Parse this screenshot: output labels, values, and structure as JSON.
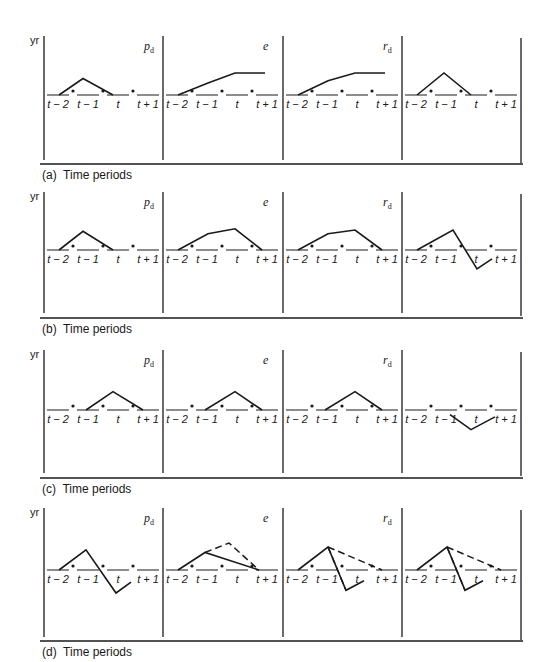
{
  "figure": {
    "y_axis_label": "yr",
    "time_labels": [
      "t − 2",
      "t − 1",
      "t",
      "t + 1"
    ],
    "panel_variables": [
      {
        "base": "p",
        "sub": "d"
      },
      {
        "base": "e",
        "sub": ""
      },
      {
        "base": "r",
        "sub": "d"
      },
      {
        "base": "",
        "sub": ""
      }
    ],
    "rows": [
      {
        "id": "a",
        "caption": "(a)  Time periods"
      },
      {
        "id": "b",
        "caption": "(b)  Time periods"
      },
      {
        "id": "c",
        "caption": "(c)  Time periods"
      },
      {
        "id": "d",
        "caption": "(d)  Time periods"
      }
    ],
    "colors": {
      "ink": "#1a1a1a",
      "background": "#ffffff"
    }
  },
  "chart_data": {
    "type": "line",
    "xlabel": "Time periods",
    "ylabel": "yr",
    "x": [
      "t-2",
      "t-1",
      "t",
      "t+1"
    ],
    "panels": [
      {
        "row": "a",
        "variable": "p_d",
        "solid": [
          [
            0.4,
            0
          ],
          [
            1.2,
            0.75
          ],
          [
            2.2,
            0
          ]
        ],
        "dashed": []
      },
      {
        "row": "a",
        "variable": "e",
        "solid": [
          [
            0.4,
            0
          ],
          [
            1.4,
            0.55
          ],
          [
            2.3,
            1.0
          ],
          [
            3.3,
            1.0
          ]
        ],
        "dashed": []
      },
      {
        "row": "a",
        "variable": "r_d",
        "solid": [
          [
            0.4,
            0
          ],
          [
            1.4,
            0.65
          ],
          [
            2.3,
            1.0
          ],
          [
            3.3,
            1.0
          ]
        ],
        "dashed": []
      },
      {
        "row": "a",
        "variable": "",
        "solid": [
          [
            0.4,
            0
          ],
          [
            1.3,
            1.0
          ],
          [
            2.2,
            0
          ]
        ],
        "dashed": []
      },
      {
        "row": "b",
        "variable": "p_d",
        "solid": [
          [
            0.4,
            0
          ],
          [
            1.2,
            0.75
          ],
          [
            2.2,
            0
          ]
        ],
        "dashed": []
      },
      {
        "row": "b",
        "variable": "e",
        "solid": [
          [
            0.4,
            0
          ],
          [
            1.4,
            0.65
          ],
          [
            2.3,
            0.85
          ],
          [
            3.2,
            0
          ]
        ],
        "dashed": []
      },
      {
        "row": "b",
        "variable": "r_d",
        "solid": [
          [
            0.4,
            0
          ],
          [
            1.4,
            0.65
          ],
          [
            2.3,
            0.8
          ],
          [
            3.2,
            0
          ]
        ],
        "dashed": []
      },
      {
        "row": "b",
        "variable": "",
        "solid": [
          [
            0.4,
            0
          ],
          [
            1.6,
            0.8
          ],
          [
            2.4,
            -0.75
          ],
          [
            2.9,
            -0.35
          ]
        ],
        "dashed": []
      },
      {
        "row": "c",
        "variable": "p_d",
        "solid": [
          [
            1.3,
            0
          ],
          [
            2.2,
            0.8
          ],
          [
            3.2,
            0
          ]
        ],
        "dashed": []
      },
      {
        "row": "c",
        "variable": "e",
        "solid": [
          [
            1.3,
            0
          ],
          [
            2.3,
            0.8
          ],
          [
            3.2,
            0
          ]
        ],
        "dashed": []
      },
      {
        "row": "c",
        "variable": "r_d",
        "solid": [
          [
            1.3,
            0
          ],
          [
            2.3,
            0.8
          ],
          [
            3.2,
            0
          ]
        ],
        "dashed": []
      },
      {
        "row": "c",
        "variable": "",
        "solid": [
          [
            1.5,
            -0.2
          ],
          [
            2.2,
            -0.85
          ],
          [
            3.0,
            -0.3
          ]
        ],
        "dashed": []
      },
      {
        "row": "d",
        "variable": "p_d",
        "solid": [
          [
            0.4,
            0
          ],
          [
            1.3,
            0.75
          ],
          [
            2.3,
            -0.85
          ],
          [
            2.8,
            -0.45
          ]
        ],
        "dashed": []
      },
      {
        "row": "d",
        "variable": "e",
        "solid": [
          [
            0.4,
            0
          ],
          [
            1.3,
            0.65
          ],
          [
            3.1,
            0
          ]
        ],
        "dashed": [
          [
            1.3,
            0.65
          ],
          [
            2.1,
            1.0
          ],
          [
            3.1,
            0
          ]
        ]
      },
      {
        "row": "d",
        "variable": "r_d",
        "solid": [
          [
            0.4,
            0
          ],
          [
            1.4,
            0.85
          ],
          [
            2.0,
            -0.75
          ],
          [
            2.6,
            -0.4
          ]
        ],
        "dashed": [
          [
            1.4,
            0.85
          ],
          [
            3.2,
            0
          ],
          [
            1.4,
            0.85
          ],
          [
            2.0,
            -0.75
          ]
        ]
      },
      {
        "row": "d",
        "variable": "",
        "solid": [
          [
            0.4,
            0
          ],
          [
            1.4,
            0.85
          ],
          [
            2.0,
            -0.75
          ],
          [
            2.6,
            -0.4
          ]
        ],
        "dashed": [
          [
            1.4,
            0.85
          ],
          [
            3.2,
            0
          ],
          [
            1.4,
            0.85
          ],
          [
            2.0,
            -0.75
          ]
        ]
      }
    ]
  }
}
